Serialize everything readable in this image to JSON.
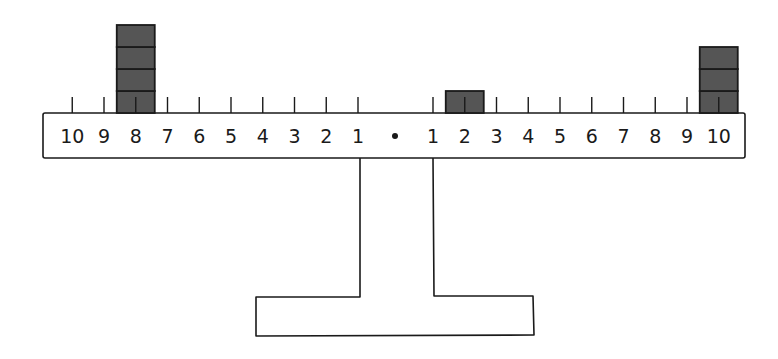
{
  "diagram": {
    "colors": {
      "ink": "#1a1a1a",
      "block": "#555555",
      "background": "#ffffff"
    },
    "beam": {
      "left_labels": [
        "10",
        "9",
        "8",
        "7",
        "6",
        "5",
        "4",
        "3",
        "2",
        "1"
      ],
      "center_label": "•",
      "right_labels": [
        "1",
        "2",
        "3",
        "4",
        "5",
        "6",
        "7",
        "8",
        "9",
        "10"
      ]
    },
    "weights": [
      {
        "side": "left",
        "position": 8,
        "count": 4
      },
      {
        "side": "right",
        "position": 2,
        "count": 1
      },
      {
        "side": "right",
        "position": 10,
        "count": 3
      }
    ]
  }
}
